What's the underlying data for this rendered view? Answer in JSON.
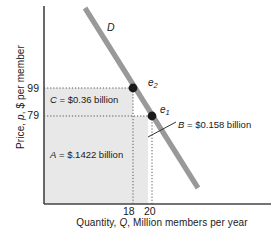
{
  "chart_data": {
    "type": "line",
    "title": "",
    "xlabel": "Quantity, Q, Million members per year",
    "ylabel": "Price, p, $ per member",
    "grid": false,
    "legend": "none",
    "xlim": [
      0,
      27
    ],
    "ylim": [
      0,
      160
    ],
    "xticks": [
      "18",
      "20"
    ],
    "xtick_values": [
      18,
      20
    ],
    "yticks": [
      "99",
      "79"
    ],
    "ytick_values": [
      99,
      79
    ],
    "series": [
      {
        "name": "D",
        "label": "D",
        "type": "line",
        "color": "#999999",
        "points": [
          {
            "x": 8.2,
            "y": 153
          },
          {
            "x": 24.6,
            "y": 19
          }
        ]
      }
    ],
    "points": [
      {
        "name": "e2",
        "label": "e",
        "subscript": "2",
        "x": 18,
        "y": 99
      },
      {
        "name": "e1",
        "label": "e",
        "subscript": "1",
        "x": 20,
        "y": 79
      }
    ],
    "regions": [
      {
        "name": "A",
        "label": "A = $.1422 billion",
        "symbol": "A",
        "value": "$.1422 billion",
        "fill": "#e8e8e8"
      },
      {
        "name": "B",
        "label": "B = $0.158 billion",
        "symbol": "B",
        "value": "$0.158 billion",
        "fill": "#e8e8e8"
      },
      {
        "name": "C",
        "label": "C = $0.36 billion",
        "symbol": "C",
        "value": "$0.36 billion",
        "fill": "#e8e8e8"
      }
    ],
    "annotations": [
      {
        "name": "demand-curve-label",
        "text": "D"
      },
      {
        "name": "point-e2-label",
        "text": "e2"
      },
      {
        "name": "point-e1-label",
        "text": "e1"
      }
    ]
  },
  "axes": {
    "y_title": "Price, p, $ per member",
    "x_title": "Quantity, Q, Million members per year",
    "y_ticks": {
      "upper": "99",
      "lower": "79"
    },
    "x_ticks": {
      "left": "18",
      "right": "20"
    }
  },
  "labels": {
    "region_c": "C = $0.36 billion",
    "region_a": "A = $.1422 billion",
    "region_b": "B = $0.158 billion",
    "demand": "D",
    "point_e2_base": "e",
    "point_e2_sub": "2",
    "point_e1_base": "e",
    "point_e1_sub": "1"
  },
  "colors": {
    "region_fill": "#e8e8e8",
    "curve": "#999999",
    "axis": "#444444",
    "text": "#1a1a1a",
    "point": "#1a1a1a",
    "dotted": "#555555"
  }
}
